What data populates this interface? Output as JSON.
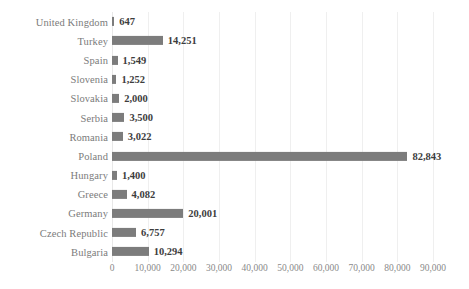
{
  "chart_data": {
    "type": "bar",
    "orientation": "horizontal",
    "title": "",
    "subtitle": "",
    "xlabel": "",
    "ylabel": "",
    "xlim": [
      0,
      90000
    ],
    "grid": true,
    "legend": null,
    "categories": [
      "United Kingdom",
      "Turkey",
      "Spain",
      "Slovenia",
      "Slovakia",
      "Serbia",
      "Romania",
      "Poland",
      "Hungary",
      "Greece",
      "Germany",
      "Czech Republic",
      "Bulgaria"
    ],
    "values": [
      647,
      14251,
      1549,
      1252,
      2000,
      3500,
      3022,
      82843,
      1400,
      4082,
      20001,
      6757,
      10294
    ],
    "data_labels": [
      "647",
      "14,251",
      "1,549",
      "1,252",
      "2,000",
      "3,500",
      "3,022",
      "82,843",
      "1,400",
      "4,082",
      "20,001",
      "6,757",
      "10,294"
    ],
    "xticks": [
      0,
      10000,
      20000,
      30000,
      40000,
      50000,
      60000,
      70000,
      80000,
      90000
    ],
    "xtick_labels": [
      "0",
      "10,000",
      "20,000",
      "30,000",
      "40,000",
      "50,000",
      "60,000",
      "70,000",
      "80,000",
      "90,000"
    ],
    "bar_color": "#7c7c7c",
    "gridline_color": "#efefef",
    "label_color": "#7b7b7b",
    "value_label_color": "#3d3d3d"
  }
}
